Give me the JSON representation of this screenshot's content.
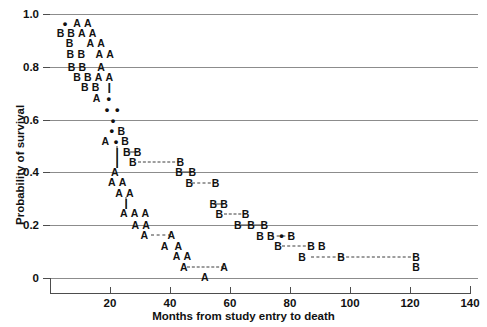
{
  "chart_data": {
    "type": "line",
    "title": "",
    "subtitle": "",
    "xlabel": "Months from study entry to death",
    "ylabel": "Probability of survival",
    "xlim": [
      0,
      140
    ],
    "ylim": [
      0,
      1.0
    ],
    "xticks": [
      0,
      20,
      40,
      60,
      80,
      100,
      120,
      140
    ],
    "xticklabels": [
      "",
      "20",
      "40",
      "60",
      "80",
      "100",
      "120",
      "140"
    ],
    "yticks": [
      0,
      0.2,
      0.4,
      0.6,
      0.8,
      1.0
    ],
    "yticklabels": [
      "0",
      "0.2",
      "0.4",
      "0.6",
      "0.8",
      "1.0"
    ],
    "grid": "horizontal",
    "legend": "none",
    "series": [
      {
        "name": "A",
        "marker_glyph": "A",
        "description": "Kaplan-Meier step curve for group A, descending from 1.0 to near 0 by about 50 months"
      },
      {
        "name": "B",
        "marker_glyph": "B",
        "description": "Kaplan-Meier step curve for group B, descending from 1.0 to near 0 by about 120 months"
      },
      {
        "name": "censored",
        "marker_glyph": "•",
        "description": "Censored observation tick marks"
      }
    ],
    "marks": [
      {
        "glyph": "•",
        "x": 5.0,
        "y": 0.965
      },
      {
        "glyph": "A",
        "x": 9.0,
        "y": 0.965
      },
      {
        "glyph": "A",
        "x": 12.6,
        "y": 0.965
      },
      {
        "glyph": "B",
        "x": 3.5,
        "y": 0.928
      },
      {
        "glyph": "B",
        "x": 7.0,
        "y": 0.928
      },
      {
        "glyph": "A",
        "x": 10.6,
        "y": 0.928
      },
      {
        "glyph": "A",
        "x": 14.2,
        "y": 0.928
      },
      {
        "glyph": "B",
        "x": 6.5,
        "y": 0.89
      },
      {
        "glyph": "A",
        "x": 13.4,
        "y": 0.89
      },
      {
        "glyph": "A",
        "x": 17.0,
        "y": 0.89
      },
      {
        "glyph": "B",
        "x": 6.8,
        "y": 0.85
      },
      {
        "glyph": "B",
        "x": 10.4,
        "y": 0.85
      },
      {
        "glyph": "A",
        "x": 16.4,
        "y": 0.85
      },
      {
        "glyph": "A",
        "x": 20.0,
        "y": 0.85
      },
      {
        "glyph": "B",
        "x": 7.2,
        "y": 0.8
      },
      {
        "glyph": "B",
        "x": 10.8,
        "y": 0.8
      },
      {
        "glyph": "A",
        "x": 17.0,
        "y": 0.8
      },
      {
        "glyph": "B",
        "x": 9.0,
        "y": 0.76
      },
      {
        "glyph": "B",
        "x": 12.6,
        "y": 0.76
      },
      {
        "glyph": "A",
        "x": 16.2,
        "y": 0.76
      },
      {
        "glyph": "A",
        "x": 19.8,
        "y": 0.76
      },
      {
        "glyph": "B",
        "x": 11.6,
        "y": 0.722
      },
      {
        "glyph": "B",
        "x": 15.2,
        "y": 0.722
      },
      {
        "glyph": "|",
        "x": 19.8,
        "y": 0.722
      },
      {
        "glyph": "A",
        "x": 15.5,
        "y": 0.68
      },
      {
        "glyph": "•",
        "x": 19.6,
        "y": 0.683
      },
      {
        "glyph": "•",
        "x": 19.0,
        "y": 0.64
      },
      {
        "glyph": "•",
        "x": 22.4,
        "y": 0.64
      },
      {
        "glyph": "•",
        "x": 21.0,
        "y": 0.6
      },
      {
        "glyph": "•",
        "x": 20.6,
        "y": 0.56
      },
      {
        "glyph": "B",
        "x": 23.8,
        "y": 0.558
      },
      {
        "glyph": "A",
        "x": 18.4,
        "y": 0.518
      },
      {
        "glyph": "•",
        "x": 22.0,
        "y": 0.52
      },
      {
        "glyph": "B",
        "x": 25.0,
        "y": 0.518
      },
      {
        "glyph": "|",
        "x": 22.4,
        "y": 0.478
      },
      {
        "glyph": "B",
        "x": 25.6,
        "y": 0.478
      },
      {
        "glyph": "B",
        "x": 29.2,
        "y": 0.478
      },
      {
        "glyph": "|",
        "x": 22.4,
        "y": 0.44
      },
      {
        "glyph": "B",
        "x": 27.6,
        "y": 0.44
      },
      {
        "glyph": "B",
        "x": 43.4,
        "y": 0.44
      },
      {
        "glyph": "A",
        "x": 21.6,
        "y": 0.4
      },
      {
        "glyph": "B",
        "x": 43.0,
        "y": 0.4
      },
      {
        "glyph": "B",
        "x": 47.4,
        "y": 0.4
      },
      {
        "glyph": "A",
        "x": 20.6,
        "y": 0.362
      },
      {
        "glyph": "A",
        "x": 24.2,
        "y": 0.362
      },
      {
        "glyph": "B",
        "x": 46.4,
        "y": 0.36
      },
      {
        "glyph": "B",
        "x": 55.2,
        "y": 0.36
      },
      {
        "glyph": "A",
        "x": 23.0,
        "y": 0.322
      },
      {
        "glyph": "A",
        "x": 26.6,
        "y": 0.322
      },
      {
        "glyph": "|",
        "x": 25.4,
        "y": 0.284
      },
      {
        "glyph": "B",
        "x": 54.4,
        "y": 0.282
      },
      {
        "glyph": "B",
        "x": 58.0,
        "y": 0.282
      },
      {
        "glyph": "A",
        "x": 24.6,
        "y": 0.245
      },
      {
        "glyph": "A",
        "x": 28.2,
        "y": 0.245
      },
      {
        "glyph": "A",
        "x": 31.8,
        "y": 0.245
      },
      {
        "glyph": "B",
        "x": 56.4,
        "y": 0.243
      },
      {
        "glyph": "B",
        "x": 65.2,
        "y": 0.243
      },
      {
        "glyph": "A",
        "x": 28.4,
        "y": 0.2
      },
      {
        "glyph": "A",
        "x": 32.0,
        "y": 0.2
      },
      {
        "glyph": "B",
        "x": 62.6,
        "y": 0.2
      },
      {
        "glyph": "B",
        "x": 67.0,
        "y": 0.2
      },
      {
        "glyph": "B",
        "x": 71.4,
        "y": 0.2
      },
      {
        "glyph": "A",
        "x": 31.4,
        "y": 0.162
      },
      {
        "glyph": "A",
        "x": 40.4,
        "y": 0.162
      },
      {
        "glyph": "B",
        "x": 70.0,
        "y": 0.16
      },
      {
        "glyph": "B",
        "x": 73.6,
        "y": 0.16
      },
      {
        "glyph": "•",
        "x": 77.2,
        "y": 0.163
      },
      {
        "glyph": "B",
        "x": 80.4,
        "y": 0.16
      },
      {
        "glyph": "A",
        "x": 38.2,
        "y": 0.122
      },
      {
        "glyph": "A",
        "x": 42.8,
        "y": 0.122
      },
      {
        "glyph": "B",
        "x": 76.0,
        "y": 0.12
      },
      {
        "glyph": "B",
        "x": 87.0,
        "y": 0.12
      },
      {
        "glyph": "B",
        "x": 90.6,
        "y": 0.12
      },
      {
        "glyph": "A",
        "x": 42.2,
        "y": 0.082
      },
      {
        "glyph": "A",
        "x": 45.8,
        "y": 0.082
      },
      {
        "glyph": "B",
        "x": 84.0,
        "y": 0.08
      },
      {
        "glyph": "B",
        "x": 97.0,
        "y": 0.08
      },
      {
        "glyph": "B",
        "x": 122.0,
        "y": 0.08
      },
      {
        "glyph": "A",
        "x": 44.6,
        "y": 0.042
      },
      {
        "glyph": "A",
        "x": 58.0,
        "y": 0.042
      },
      {
        "glyph": "B",
        "x": 122.0,
        "y": 0.04
      },
      {
        "glyph": "A",
        "x": 51.6,
        "y": 0.005
      }
    ],
    "segments": [
      {
        "orientation": "h",
        "style": "dashed",
        "x1": 29.2,
        "x2": 43.4,
        "y": 0.44
      },
      {
        "orientation": "h",
        "style": "dashed",
        "x1": 47.4,
        "x2": 55.2,
        "y": 0.36
      },
      {
        "orientation": "h",
        "style": "dashed",
        "x1": 58.0,
        "x2": 65.2,
        "y": 0.243
      },
      {
        "orientation": "h",
        "style": "dashed",
        "x1": 73.6,
        "x2": 80.4,
        "y": 0.16
      },
      {
        "orientation": "h",
        "style": "dashed",
        "x1": 77.2,
        "x2": 87.0,
        "y": 0.12
      },
      {
        "orientation": "h",
        "style": "dashed",
        "x1": 87.0,
        "x2": 97.0,
        "y": 0.08
      },
      {
        "orientation": "h",
        "style": "dashed",
        "x1": 97.0,
        "x2": 122.0,
        "y": 0.08
      },
      {
        "orientation": "h",
        "style": "dashed",
        "x1": 33.6,
        "x2": 40.4,
        "y": 0.162
      },
      {
        "orientation": "h",
        "style": "dashed",
        "x1": 45.8,
        "x2": 58.0,
        "y": 0.042
      },
      {
        "orientation": "h",
        "style": "solid",
        "x1": 43.0,
        "x2": 47.4,
        "y": 0.4
      },
      {
        "orientation": "h",
        "style": "solid",
        "x1": 54.4,
        "x2": 58.0,
        "y": 0.282
      },
      {
        "orientation": "h",
        "style": "solid",
        "x1": 62.6,
        "x2": 71.4,
        "y": 0.2
      },
      {
        "orientation": "h",
        "style": "solid",
        "x1": 26.0,
        "x2": 29.2,
        "y": 0.478
      },
      {
        "orientation": "v",
        "style": "solid",
        "y1": 0.5,
        "y2": 0.455,
        "x": 22.4
      },
      {
        "orientation": "v",
        "style": "solid",
        "y1": 0.455,
        "y2": 0.418,
        "x": 22.4
      },
      {
        "orientation": "v",
        "style": "solid",
        "y1": 0.74,
        "y2": 0.7,
        "x": 19.8
      },
      {
        "orientation": "v",
        "style": "solid",
        "y1": 0.305,
        "y2": 0.262,
        "x": 25.4
      }
    ]
  },
  "axis": {
    "xlabel": "Months from study entry to death",
    "ylabel": "Probability of survival"
  }
}
